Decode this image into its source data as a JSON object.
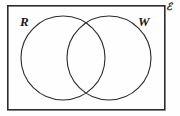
{
  "figure": {
    "type": "venn-diagram",
    "background_color": "#fefefe",
    "stroke_color": "#2b2b2b",
    "label_color": "#1b1b1b",
    "universal_set": {
      "label": "ℰ",
      "name": "universal-set-label",
      "shape": "rectangle",
      "x": 7,
      "y": 5,
      "width": 158,
      "height": 105,
      "stroke_width": 1.6
    },
    "sets": [
      {
        "label": "R",
        "name": "set-r",
        "cx": 63,
        "cy": 58,
        "r": 42,
        "stroke_width": 1.1,
        "label_x": 20,
        "label_y": 15
      },
      {
        "label": "W",
        "name": "set-w",
        "cx": 109,
        "cy": 58,
        "r": 42,
        "stroke_width": 1.1,
        "label_x": 138,
        "label_y": 15
      }
    ],
    "regions": [
      "R only",
      "R and W intersection",
      "W only",
      "outside both circles"
    ]
  }
}
